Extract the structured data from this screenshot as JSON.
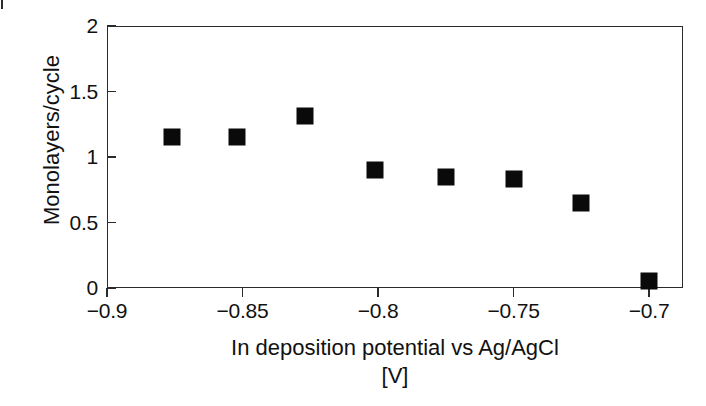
{
  "figure": {
    "background_color": "#ffffff",
    "foreground_color": "#0a0a0a",
    "scan_artifact": "top-left-tick-mark"
  },
  "chart_data": {
    "type": "scatter",
    "title": "",
    "xlabel": "In deposition potential vs Ag/AgCl",
    "xlabel_unit": "[V]",
    "ylabel": "Monolayers/cycle",
    "xlim": [
      -0.9,
      -0.6875
    ],
    "ylim": [
      0,
      2
    ],
    "xticks": [
      -0.9,
      -0.85,
      -0.8,
      -0.75,
      -0.7
    ],
    "xtick_labels": [
      "−0.9",
      "−0.85",
      "−0.8",
      "−0.75",
      "−0.7"
    ],
    "yticks": [
      0,
      0.5,
      1,
      1.5,
      2
    ],
    "ytick_labels": [
      "0",
      "0.5",
      "1",
      "1.5",
      "2"
    ],
    "grid": false,
    "legend": false,
    "marker": "square",
    "marker_color": "#0a0a0a",
    "marker_size_px": 17,
    "points": [
      {
        "x": -0.876,
        "y": 1.15
      },
      {
        "x": -0.852,
        "y": 1.15
      },
      {
        "x": -0.827,
        "y": 1.31
      },
      {
        "x": -0.801,
        "y": 0.9
      },
      {
        "x": -0.775,
        "y": 0.85
      },
      {
        "x": -0.75,
        "y": 0.83
      },
      {
        "x": -0.725,
        "y": 0.65
      },
      {
        "x": -0.7,
        "y": 0.05
      }
    ],
    "series": [
      {
        "name": "Monolayers per cycle",
        "x": [
          -0.876,
          -0.852,
          -0.827,
          -0.801,
          -0.775,
          -0.75,
          -0.725,
          -0.7
        ],
        "values": [
          1.15,
          1.15,
          1.31,
          0.9,
          0.85,
          0.83,
          0.65,
          0.05
        ]
      }
    ]
  }
}
